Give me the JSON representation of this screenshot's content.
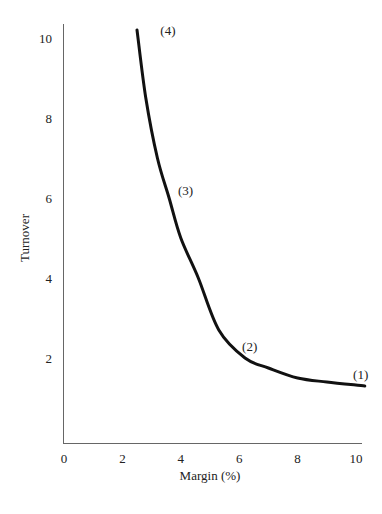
{
  "chart_data": {
    "type": "line",
    "title": "",
    "xlabel": "Margin (%)",
    "ylabel": "Turnover",
    "xlim": [
      0,
      10
    ],
    "ylim": [
      0,
      10
    ],
    "grid": false,
    "legend": null,
    "x_ticks": [
      "0",
      "2",
      "4",
      "6",
      "8",
      "10"
    ],
    "y_ticks": [
      "2",
      "4",
      "6",
      "8",
      "10"
    ],
    "series": [
      {
        "name": "Turnover vs Margin",
        "color": "#111111",
        "x": [
          2.5,
          2.8,
          3.2,
          3.6,
          4.0,
          4.6,
          5.3,
          6.2,
          7.0,
          8.0,
          9.0,
          10.3
        ],
        "y": [
          10.2,
          8.5,
          7.0,
          6.0,
          5.0,
          4.0,
          2.7,
          2.0,
          1.75,
          1.5,
          1.4,
          1.3
        ]
      }
    ],
    "annotations": [
      {
        "label": "(4)",
        "x": 3.3,
        "y": 10.2
      },
      {
        "label": "(3)",
        "x": 3.9,
        "y": 6.2
      },
      {
        "label": "(2)",
        "x": 6.1,
        "y": 2.3
      },
      {
        "label": "(1)",
        "x": 9.9,
        "y": 1.6
      }
    ]
  }
}
